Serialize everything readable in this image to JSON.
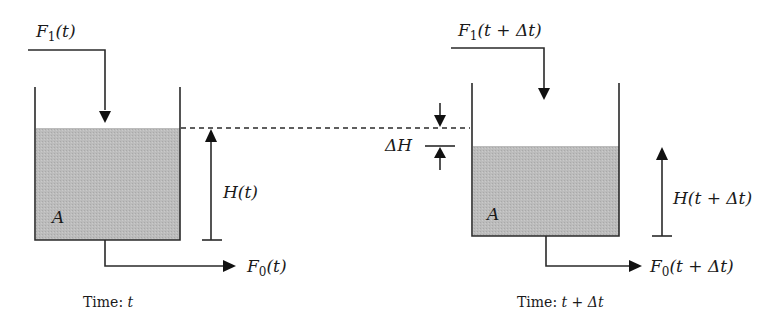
{
  "diagram": {
    "colors": {
      "liquid": "#b9b9b9",
      "stroke": "#2a2a2a",
      "background": "#ffffff"
    },
    "left_tank": {
      "inflow": {
        "symbol": "F",
        "subscript": "1",
        "arg": "(t)"
      },
      "outflow": {
        "symbol": "F",
        "subscript": "0",
        "arg": "(t)"
      },
      "height": {
        "symbol": "H",
        "arg": "(t)"
      },
      "area_label": "A",
      "caption_prefix": "Time: ",
      "caption_var": "t"
    },
    "right_tank": {
      "inflow": {
        "symbol": "F",
        "subscript": "1",
        "arg": "(t + Δt)"
      },
      "outflow": {
        "symbol": "F",
        "subscript": "0",
        "arg": "(t + Δt)"
      },
      "height": {
        "symbol": "H",
        "arg": "(t + Δt)"
      },
      "area_label": "A",
      "caption_prefix": "Time: ",
      "caption_var": "t + Δt"
    },
    "delta": {
      "label": "ΔH"
    }
  }
}
